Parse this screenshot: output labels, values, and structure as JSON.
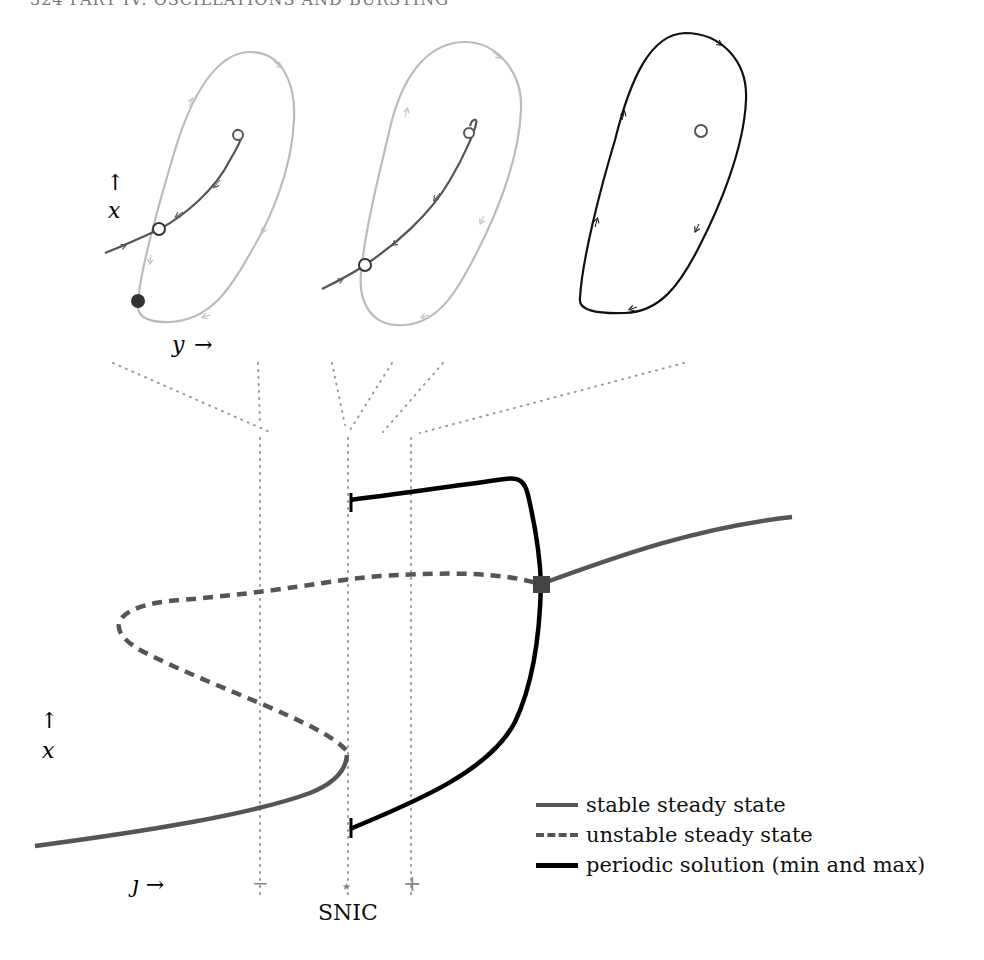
{
  "header": {
    "text": "324    PART IV: OSCILLATIONS AND BURSTING"
  },
  "phase_portraits": {
    "x_axis_label": "y",
    "y_axis_label": "x",
    "panels": [
      {
        "id": "before-snic",
        "description": "stable node (filled) and saddle (open) on invariant circle; unstable focus inside",
        "curve_color": "#bbbbbb"
      },
      {
        "id": "at-snic",
        "description": "saddle-node on invariant circle; unstable focus inside",
        "curve_color": "#bbbbbb"
      },
      {
        "id": "after-snic",
        "description": "stable limit cycle around unstable focus",
        "curve_color": "#111111"
      }
    ]
  },
  "bifurcation_diagram": {
    "x_axis_label": "ȷ →",
    "y_axis_label": "x",
    "markers": [
      {
        "label": "−",
        "name": "minus"
      },
      {
        "label": "⋆",
        "name": "star"
      },
      {
        "label": "+",
        "name": "plus"
      }
    ],
    "snic_label": "SNIC"
  },
  "legend": {
    "items": [
      {
        "label": "stable steady state",
        "style": "solid-gray"
      },
      {
        "label": "unstable steady state",
        "style": "dashed-gray"
      },
      {
        "label": "periodic solution (min and max)",
        "style": "solid-black"
      }
    ]
  },
  "colors": {
    "stable": "#555555",
    "unstable": "#555555",
    "periodic": "#000000",
    "light_orbit": "#bbbbbb",
    "guide": "#999999"
  }
}
